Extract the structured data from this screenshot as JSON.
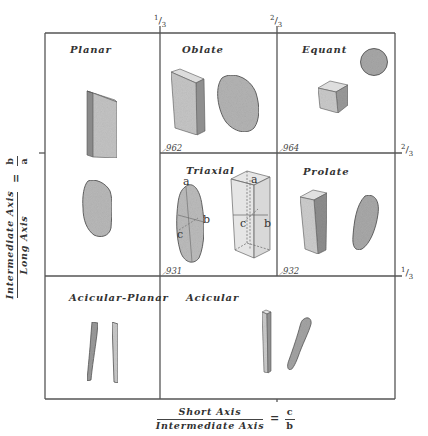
{
  "diagram": {
    "top_ticks": [
      {
        "label": "1/3",
        "num": "1",
        "den": "3"
      },
      {
        "label": "2/3",
        "num": "2",
        "den": "3"
      }
    ],
    "right_ticks": [
      {
        "label": "2/3",
        "num": "2",
        "den": "3"
      },
      {
        "label": "1/3",
        "num": "1",
        "den": "3"
      }
    ],
    "x_axis": {
      "numerator": "Short Axis",
      "denominator": "Intermediate Axis",
      "equals": "=",
      "ratio_num": "c",
      "ratio_den": "b"
    },
    "y_axis": {
      "numerator": "Intermediate Axis",
      "denominator": "Long Axis",
      "equals": "=",
      "ratio_num": "b",
      "ratio_den": "a"
    },
    "cells": [
      {
        "id": "planar",
        "label": "Planar",
        "shapes": [
          "thin-plate",
          "flat-pebble"
        ]
      },
      {
        "id": "oblate",
        "label": "Oblate",
        "code": "962",
        "shapes": [
          "thick-plate",
          "oval-pebble"
        ]
      },
      {
        "id": "equant",
        "label": "Equant",
        "code": "964",
        "shapes": [
          "cube",
          "sphere"
        ]
      },
      {
        "id": "triaxial",
        "label": "Triaxial",
        "code": "931",
        "shapes": [
          "ellipsoid-with-axes",
          "transparent-prism-with-axes"
        ],
        "axis_labels": [
          "a",
          "b",
          "c"
        ]
      },
      {
        "id": "prolate",
        "label": "Prolate",
        "code": "932",
        "shapes": [
          "elongated-prism",
          "elongated-pebble"
        ]
      },
      {
        "id": "acicular-planar",
        "label": "Acicular-Planar",
        "shapes": [
          "curved-needle",
          "flat-needle"
        ]
      },
      {
        "id": "acicular",
        "label": "Acicular",
        "shapes": [
          "straight-rod",
          "curved-rod"
        ]
      }
    ],
    "colors": {
      "line": "#555555",
      "shape_fill": "#bdbdbd",
      "shape_dark": "#8a8a8a",
      "background": "#ffffff"
    }
  }
}
